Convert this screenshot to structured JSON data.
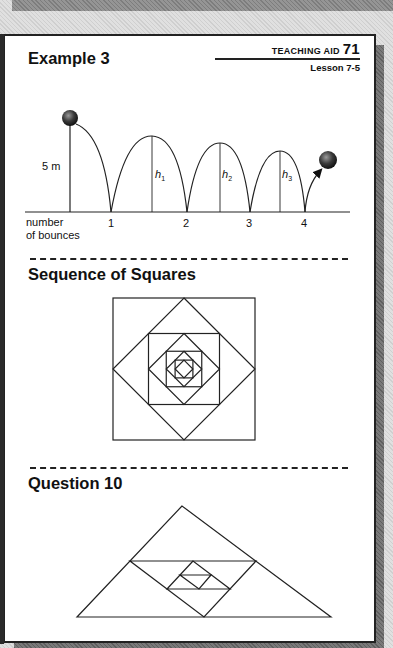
{
  "header": {
    "aid_label": "TEACHING AID",
    "aid_number": "71",
    "lesson": "Lesson 7-5"
  },
  "sections": [
    {
      "title": "Example 3",
      "diagram": {
        "height_label": "5 m",
        "axis_label_line1": "number",
        "axis_label_line2": "of bounces",
        "bounce_numbers": [
          "1",
          "2",
          "3",
          "4"
        ],
        "heights": [
          "h",
          "h",
          "h"
        ],
        "height_subscripts": [
          "1",
          "2",
          "3"
        ]
      }
    },
    {
      "title": "Sequence of Squares"
    },
    {
      "title": "Question 10"
    }
  ],
  "colors": {
    "ink": "#222222",
    "page": "#ffffff",
    "shadow": "#707070"
  }
}
